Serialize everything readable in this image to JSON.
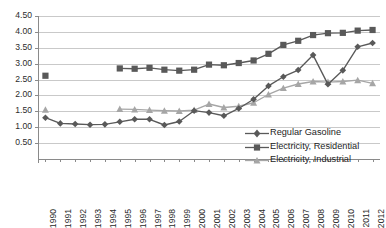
{
  "chart_data": {
    "type": "line",
    "title": "",
    "xlabel": "",
    "ylabel": "",
    "ylim": [
      0.0,
      4.5
    ],
    "ytick_step": 0.5,
    "grid": true,
    "legend_position": "inside-bottom-right",
    "categories": [
      "1990",
      "1991",
      "1992",
      "1993",
      "1994",
      "1995",
      "1996",
      "1997",
      "1998",
      "1999",
      "2000",
      "2001",
      "2002",
      "2003",
      "2004",
      "2005",
      "2006",
      "2007",
      "2008",
      "2009",
      "2010",
      "2011",
      "2012"
    ],
    "ytick_labels": [
      "0.50",
      "1.00",
      "1.50",
      "2.00",
      "2.50",
      "3.00",
      "3.50",
      "4.00",
      "4.50"
    ],
    "series": [
      {
        "name": "Regular Gasoline",
        "color": "#595959",
        "marker": "diamond",
        "values": [
          1.3,
          1.12,
          1.1,
          1.08,
          1.09,
          1.17,
          1.25,
          1.25,
          1.07,
          1.18,
          1.52,
          1.46,
          1.36,
          1.59,
          1.88,
          2.3,
          2.59,
          2.8,
          3.27,
          2.35,
          2.79,
          3.53,
          3.65
        ]
      },
      {
        "name": "Electricity, Residential",
        "color": "#595959",
        "marker": "square",
        "values": [
          2.62,
          null,
          null,
          null,
          null,
          2.85,
          2.84,
          2.87,
          2.81,
          2.78,
          2.81,
          2.97,
          2.95,
          3.02,
          3.1,
          3.31,
          3.59,
          3.72,
          3.9,
          3.96,
          3.97,
          4.04,
          4.06
        ]
      },
      {
        "name": "Electricity, Industrial",
        "color": "#a6a6a6",
        "marker": "triangle",
        "values": [
          1.55,
          null,
          null,
          null,
          null,
          1.57,
          1.56,
          1.54,
          1.52,
          1.51,
          1.54,
          1.73,
          1.62,
          1.66,
          1.77,
          2.03,
          2.23,
          2.36,
          2.44,
          2.42,
          2.44,
          2.48,
          2.38
        ]
      }
    ]
  },
  "legend": {
    "items": [
      {
        "label": "Regular Gasoline"
      },
      {
        "label": "Electricity, Residential"
      },
      {
        "label": "Electricity, Industrial"
      }
    ]
  }
}
